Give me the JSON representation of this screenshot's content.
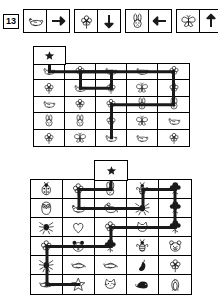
{
  "puzzle": {
    "number": "13",
    "title": "Icon maze puzzle worksheet"
  },
  "legend": {
    "rules": [
      {
        "icon": "seal-icon",
        "direction": "arrow-right-icon",
        "dir": "right"
      },
      {
        "icon": "flower-icon",
        "direction": "arrow-down-icon",
        "dir": "down"
      },
      {
        "icon": "rabbit-icon",
        "direction": "arrow-left-icon",
        "dir": "left"
      },
      {
        "icon": "butterfly-icon",
        "direction": "arrow-up-icon",
        "dir": "up"
      }
    ]
  },
  "boards": [
    {
      "name": "board-one",
      "cols": 5,
      "rows": 5,
      "start_marker": "star-icon",
      "start_col": 1,
      "cells": [
        [
          "seal",
          "flower",
          "seal",
          "seal",
          "flower"
        ],
        [
          "flower",
          "seal",
          "flower",
          "butterfly",
          "flower"
        ],
        [
          "seal",
          "flower",
          "flower",
          "rabbit",
          "rabbit"
        ],
        [
          "rabbit",
          "rabbit",
          "flower",
          "butterfly",
          "seal"
        ],
        [
          "flower",
          "butterfly",
          "seal",
          "seal",
          "flower"
        ]
      ],
      "path": [
        {
          "x1": 0.5,
          "y1": -0.55,
          "x2": 0.5,
          "y2": 0.5
        },
        {
          "x1": 0.5,
          "y1": 0.5,
          "x2": 2.5,
          "y2": 0.5
        },
        {
          "x1": 2.5,
          "y1": 0.5,
          "x2": 2.5,
          "y2": 1.5
        },
        {
          "x1": 2.5,
          "y1": 1.5,
          "x2": 1.5,
          "y2": 1.5
        },
        {
          "x1": 1.5,
          "y1": 1.5,
          "x2": 1.5,
          "y2": 0.5
        },
        {
          "x1": 1.5,
          "y1": 0.5,
          "x2": 4.5,
          "y2": 0.5
        },
        {
          "x1": 4.5,
          "y1": 0.5,
          "x2": 4.5,
          "y2": 2.5
        },
        {
          "x1": 4.5,
          "y1": 2.5,
          "x2": 2.5,
          "y2": 2.5
        },
        {
          "x1": 2.5,
          "y1": 2.5,
          "x2": 2.5,
          "y2": 4.5
        }
      ]
    },
    {
      "name": "board-two",
      "cols": 5,
      "rows": 6,
      "start_marker": "star-icon",
      "start_col": 3,
      "cells": [
        [
          "ladybug",
          "flower",
          "rabbit",
          "bee",
          "tree"
        ],
        [
          "owl",
          "seal",
          "mouse",
          "spider",
          "tree"
        ],
        [
          "spider",
          "heart",
          "flower",
          "cat-face",
          "tree"
        ],
        [
          "flower",
          "panda",
          "tree",
          "bee",
          "bear-face"
        ],
        [
          "spider",
          "bird",
          "bird",
          "chili",
          "flower"
        ],
        [
          "bird",
          "star-small",
          "cat-face",
          "hedgehog",
          "penguin"
        ]
      ],
      "path": [
        {
          "x1": 2.5,
          "y1": -0.55,
          "x2": 2.5,
          "y2": 0.5
        },
        {
          "x1": 2.5,
          "y1": 0.5,
          "x2": 1.5,
          "y2": 0.5
        },
        {
          "x1": 1.5,
          "y1": 0.5,
          "x2": 1.5,
          "y2": 1.5
        },
        {
          "x1": 1.5,
          "y1": 1.5,
          "x2": 3.5,
          "y2": 1.5
        },
        {
          "x1": 3.5,
          "y1": 1.5,
          "x2": 3.5,
          "y2": 0.5
        },
        {
          "x1": 3.5,
          "y1": 0.5,
          "x2": 4.5,
          "y2": 0.5
        },
        {
          "x1": 4.5,
          "y1": 0.5,
          "x2": 4.5,
          "y2": 2.5
        },
        {
          "x1": 4.5,
          "y1": 2.5,
          "x2": 2.5,
          "y2": 2.5
        },
        {
          "x1": 2.5,
          "y1": 2.5,
          "x2": 2.5,
          "y2": 3.5
        },
        {
          "x1": 2.5,
          "y1": 3.5,
          "x2": 0.5,
          "y2": 3.5
        },
        {
          "x1": 0.5,
          "y1": 3.5,
          "x2": 0.5,
          "y2": 5.5
        },
        {
          "x1": 0.5,
          "y1": 5.5,
          "x2": 1.5,
          "y2": 5.5
        }
      ]
    }
  ],
  "colors": {
    "ink": "#1a1a1a",
    "line": "#000000",
    "paper": "#ffffff"
  }
}
